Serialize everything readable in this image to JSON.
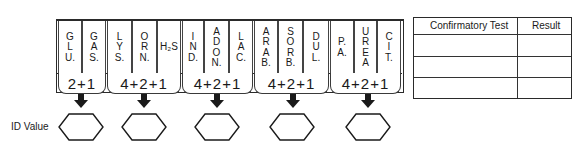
{
  "panel": {
    "groups": [
      {
        "sum_label": "2+1",
        "tests": [
          {
            "label": "G\nL\nU."
          },
          {
            "label": "G\nA\nS."
          }
        ]
      },
      {
        "sum_label": "4+2+1",
        "tests": [
          {
            "label": "L\nY\nS."
          },
          {
            "label": "O\nR\nN."
          },
          {
            "label": "H₂S"
          }
        ]
      },
      {
        "sum_label": "4+2+1",
        "tests": [
          {
            "label": "I\nN\nD."
          },
          {
            "label": "A\nD\nO\nN."
          },
          {
            "label": "L\nA\nC."
          }
        ]
      },
      {
        "sum_label": "4+2+1",
        "tests": [
          {
            "label": "A\nR\nA\nB."
          },
          {
            "label": "S\nO\nR\nB."
          },
          {
            "label": "D\nU\nL."
          }
        ]
      },
      {
        "sum_label": "4+2+1",
        "tests": [
          {
            "label": "P.\nA."
          },
          {
            "label": "U\nR\nE\nA"
          },
          {
            "label": "C\nI\nT."
          }
        ]
      }
    ]
  },
  "id_value": {
    "label": "ID Value",
    "boxes": [
      "",
      "",
      "",
      "",
      ""
    ],
    "icon": "down-arrow-icon"
  },
  "confirmatory_table": {
    "headers": [
      "Confirmatory Test",
      "Result"
    ],
    "rows": [
      [
        "",
        ""
      ],
      [
        "",
        ""
      ],
      [
        "",
        ""
      ]
    ]
  },
  "colors": {
    "ink": "#1a1a1a",
    "background": "#ffffff"
  }
}
